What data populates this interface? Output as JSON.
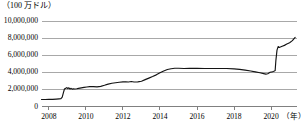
{
  "chart_data": {
    "type": "line",
    "title": "",
    "subtitle": "",
    "unit_label": "（100 万ドル）",
    "xlabel": "（年）",
    "ylabel": "",
    "grid": true,
    "legend": false,
    "legend_position": "none",
    "line_color": "#141414",
    "grid_color": "#6e6e6e",
    "axis_color": "#4a4a4a",
    "background_color": "#ffffff",
    "xlim": [
      2007.6,
      2021.4
    ],
    "ylim": [
      0,
      10000000
    ],
    "y_ticks": [
      0,
      2000000,
      4000000,
      6000000,
      8000000,
      10000000
    ],
    "y_tick_labels": [
      "0",
      "2,000,000",
      "4,000,000",
      "6,000,000",
      "8,000,000",
      "10,000,000"
    ],
    "x_ticks": [
      2008,
      2010,
      2012,
      2014,
      2016,
      2018,
      2020
    ],
    "x_tick_labels": [
      "2008",
      "2010",
      "2012",
      "2014",
      "2016",
      "2018",
      "2020"
    ],
    "series": [
      {
        "name": "",
        "x": [
          2007.6,
          2007.8,
          2008.0,
          2008.2,
          2008.4,
          2008.55,
          2008.65,
          2008.72,
          2008.78,
          2008.84,
          2008.9,
          2008.96,
          2009.02,
          2009.08,
          2009.14,
          2009.2,
          2009.26,
          2009.32,
          2009.4,
          2009.5,
          2009.6,
          2009.75,
          2009.9,
          2010.05,
          2010.2,
          2010.4,
          2010.6,
          2010.8,
          2011.0,
          2011.2,
          2011.4,
          2011.6,
          2011.8,
          2012.0,
          2012.15,
          2012.3,
          2012.45,
          2012.6,
          2012.8,
          2013.0,
          2013.2,
          2013.4,
          2013.6,
          2013.8,
          2014.0,
          2014.2,
          2014.4,
          2014.6,
          2014.8,
          2015.0,
          2015.3,
          2015.6,
          2016.0,
          2016.4,
          2016.8,
          2017.2,
          2017.6,
          2018.0,
          2018.3,
          2018.6,
          2018.9,
          2019.15,
          2019.4,
          2019.6,
          2019.72,
          2019.82,
          2019.95,
          2020.05,
          2020.12,
          2020.18,
          2020.22,
          2020.26,
          2020.32,
          2020.38,
          2020.44,
          2020.5,
          2020.6,
          2020.72,
          2020.85,
          2021.0,
          2021.15,
          2021.3
        ],
        "values": [
          820000,
          820000,
          830000,
          840000,
          870000,
          900000,
          920000,
          1100000,
          1600000,
          2050000,
          2120000,
          2210000,
          2100000,
          2180000,
          2050000,
          2120000,
          2030000,
          2060000,
          2050000,
          2080000,
          2120000,
          2180000,
          2230000,
          2280000,
          2330000,
          2320000,
          2300000,
          2350000,
          2480000,
          2620000,
          2720000,
          2780000,
          2830000,
          2880000,
          2900000,
          2870000,
          2920000,
          2870000,
          2880000,
          2950000,
          3140000,
          3320000,
          3500000,
          3700000,
          3950000,
          4150000,
          4330000,
          4420000,
          4480000,
          4470000,
          4450000,
          4460000,
          4460000,
          4450000,
          4440000,
          4450000,
          4440000,
          4400000,
          4350000,
          4250000,
          4150000,
          4050000,
          3950000,
          3850000,
          3790000,
          3830000,
          4000000,
          4050000,
          4100000,
          4150000,
          4200000,
          5400000,
          6600000,
          7010000,
          6900000,
          6950000,
          7050000,
          7150000,
          7300000,
          7450000,
          7700000,
          8080000
        ]
      }
    ],
    "annotations": []
  }
}
